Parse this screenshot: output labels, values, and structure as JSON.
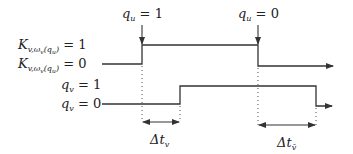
{
  "diagram": {
    "type": "timing-diagram",
    "labels": {
      "k_high": {
        "main": "K",
        "sub": "v,ω",
        "sub2": "v",
        "arg": "(q",
        "arg_sub": "u",
        "close": ")",
        "eq": " = 1"
      },
      "k_low": {
        "main": "K",
        "sub": "v,ω",
        "sub2": "v",
        "arg": "(q",
        "arg_sub": "u",
        "close": ")",
        "eq": " = 0"
      },
      "qv_high": {
        "main": "q",
        "sub": "v",
        "eq": " = 1"
      },
      "qv_low": {
        "main": "q",
        "sub": "v",
        "eq": " = 0"
      },
      "qu_one": {
        "main": "q",
        "sub": "u",
        "eq": " = 1"
      },
      "qu_zero": {
        "main": "q",
        "sub": "u",
        "eq": " = 0"
      },
      "dt_v": {
        "main": "Δt",
        "sub": "v"
      },
      "dt_vbar": {
        "main": "Δt",
        "sub": "v̄"
      }
    },
    "signals": {
      "upper": {
        "name": "K_v,ωv(qu)",
        "rise_x": 142,
        "fall_x": 258,
        "high_y": 45,
        "low_y": 64,
        "end_low_y": 66
      },
      "lower": {
        "name": "q_v",
        "rise_x": 180,
        "fall_x": 316,
        "high_y": 86,
        "low_y": 104,
        "end_low_y": 106
      }
    },
    "intervals": [
      {
        "label": "Δt_v",
        "from_x": 142,
        "to_x": 180
      },
      {
        "label": "Δt_v̄",
        "from_x": 258,
        "to_x": 316
      }
    ]
  }
}
